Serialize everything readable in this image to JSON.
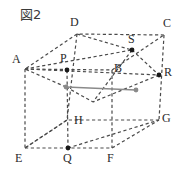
{
  "figure": {
    "caption": "図2",
    "type": "cube-diagram",
    "colors": {
      "edge": "#4a4a4a",
      "highlight": "#8a8a8a",
      "label": "#2b2b2b",
      "point": "#1a1a1a",
      "background": "#ffffff"
    },
    "vertices": [
      {
        "name": "A",
        "x": 25,
        "y": 69,
        "label_x": 12,
        "label_y": 53,
        "dot": false
      },
      {
        "name": "B",
        "x": 112,
        "y": 70,
        "label_x": 114,
        "label_y": 62,
        "dot": false
      },
      {
        "name": "C",
        "x": 164,
        "y": 35,
        "label_x": 163,
        "label_y": 17,
        "dot": false
      },
      {
        "name": "D",
        "x": 77,
        "y": 34,
        "label_x": 70,
        "label_y": 16,
        "dot": false
      },
      {
        "name": "E",
        "x": 25,
        "y": 148,
        "label_x": 15,
        "label_y": 152,
        "dot": false
      },
      {
        "name": "F",
        "x": 112,
        "y": 148,
        "label_x": 107,
        "label_y": 152,
        "dot": false
      },
      {
        "name": "G",
        "x": 159,
        "y": 120,
        "label_x": 162,
        "label_y": 112,
        "dot": false
      },
      {
        "name": "H",
        "x": 67,
        "y": 120,
        "label_x": 74,
        "label_y": 114,
        "dot": false
      },
      {
        "name": "P",
        "x": 67,
        "y": 70,
        "label_x": 60,
        "label_y": 52,
        "dot": true
      },
      {
        "name": "Q",
        "x": 68,
        "y": 148,
        "label_x": 63,
        "label_y": 152,
        "dot": true
      },
      {
        "name": "R",
        "x": 159,
        "y": 75,
        "label_x": 164,
        "label_y": 66,
        "dot": true
      },
      {
        "name": "S",
        "x": 132,
        "y": 50,
        "label_x": 128,
        "label_y": 33,
        "dot": true
      }
    ],
    "edges_dashed": [
      {
        "name": "edge-AB",
        "x1": 25,
        "y1": 69,
        "x2": 112,
        "y2": 70
      },
      {
        "name": "edge-BC",
        "x1": 112,
        "y1": 70,
        "x2": 164,
        "y2": 35
      },
      {
        "name": "edge-CD",
        "x1": 164,
        "y1": 35,
        "x2": 77,
        "y2": 34
      },
      {
        "name": "edge-DA",
        "x1": 77,
        "y1": 34,
        "x2": 25,
        "y2": 69
      },
      {
        "name": "edge-EF",
        "x1": 25,
        "y1": 148,
        "x2": 112,
        "y2": 148
      },
      {
        "name": "edge-FG",
        "x1": 112,
        "y1": 148,
        "x2": 159,
        "y2": 120
      },
      {
        "name": "edge-GH",
        "x1": 159,
        "y1": 120,
        "x2": 67,
        "y2": 120
      },
      {
        "name": "edge-HE",
        "x1": 67,
        "y1": 120,
        "x2": 25,
        "y2": 148
      },
      {
        "name": "edge-AE",
        "x1": 25,
        "y1": 69,
        "x2": 25,
        "y2": 148
      },
      {
        "name": "edge-BF",
        "x1": 112,
        "y1": 70,
        "x2": 112,
        "y2": 148
      },
      {
        "name": "edge-CG",
        "x1": 164,
        "y1": 35,
        "x2": 159,
        "y2": 120
      },
      {
        "name": "edge-DH",
        "x1": 77,
        "y1": 34,
        "x2": 67,
        "y2": 120
      },
      {
        "name": "segment-PQ",
        "x1": 67,
        "y1": 70,
        "x2": 68,
        "y2": 148
      },
      {
        "name": "segment-AS",
        "x1": 25,
        "y1": 69,
        "x2": 132,
        "y2": 50
      },
      {
        "name": "segment-AR",
        "x1": 25,
        "y1": 69,
        "x2": 159,
        "y2": 75
      },
      {
        "name": "segment-DS",
        "x1": 77,
        "y1": 34,
        "x2": 132,
        "y2": 50
      },
      {
        "name": "segment-SR",
        "x1": 132,
        "y1": 50,
        "x2": 159,
        "y2": 75
      },
      {
        "name": "segment-S-mid",
        "x1": 132,
        "y1": 50,
        "x2": 93,
        "y2": 102
      },
      {
        "name": "segment-R-mid",
        "x1": 159,
        "y1": 75,
        "x2": 93,
        "y2": 102
      },
      {
        "name": "segment-P-mid",
        "x1": 66,
        "y1": 87,
        "x2": 93,
        "y2": 102
      },
      {
        "name": "segment-left-mid",
        "x1": 66,
        "y1": 87,
        "x2": 25,
        "y2": 69
      },
      {
        "name": "segment-E-H",
        "x1": 25,
        "y1": 148,
        "x2": 67,
        "y2": 120
      },
      {
        "name": "segment-Q-G",
        "x1": 68,
        "y1": 148,
        "x2": 159,
        "y2": 120
      }
    ],
    "edges_solid_highlight": [
      {
        "name": "segment-highlight",
        "x1": 66,
        "y1": 87,
        "x2": 136,
        "y2": 90
      }
    ],
    "extra_points": [
      {
        "name": "point-left-mid",
        "x": 66,
        "y": 87
      },
      {
        "name": "point-right-mid",
        "x": 136,
        "y": 90
      }
    ]
  }
}
